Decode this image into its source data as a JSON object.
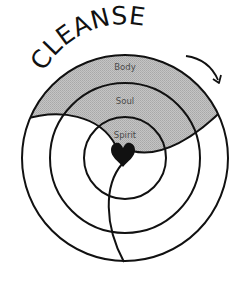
{
  "diagram": {
    "title": "CLEANSE",
    "rings": [
      {
        "label": "Body"
      },
      {
        "label": "Soul"
      },
      {
        "label": "Spirit"
      }
    ],
    "center_symbol": "heart-icon",
    "direction_indicator": "curved-arrow-clockwise"
  },
  "colors": {
    "line": "#111111",
    "shaded_region": "#b9b9b9",
    "label_text": "#4a4a4a",
    "background": "#ffffff"
  }
}
